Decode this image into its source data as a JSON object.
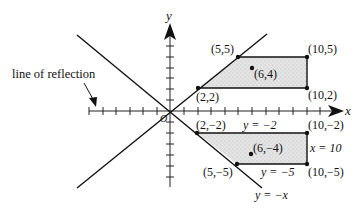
{
  "diagram": {
    "type": "coordinate-plane-reflection",
    "axes": {
      "x_label": "x",
      "y_label": "y",
      "origin_label": "O"
    },
    "reflection_line_label": "line of reflection",
    "lines": {
      "diag_up": "y = x",
      "diag_down": "y = −x"
    },
    "upper_region": {
      "vertices": [
        "(2,2)",
        "(5,5)",
        "(10,5)",
        "(10,2)"
      ],
      "interior_point": "(6,4)"
    },
    "lower_region": {
      "vertices": [
        "(2,−2)",
        "(5,−5)",
        "(10,−5)",
        "(10,−2)"
      ],
      "interior_point": "(6,−4)",
      "boundary_labels": {
        "top": "y = −2",
        "bottom": "y = −5",
        "right": "x = 10",
        "diag": "y = −x"
      }
    },
    "colors": {
      "ink": "#111111",
      "shade": "#d9d9d9"
    }
  }
}
